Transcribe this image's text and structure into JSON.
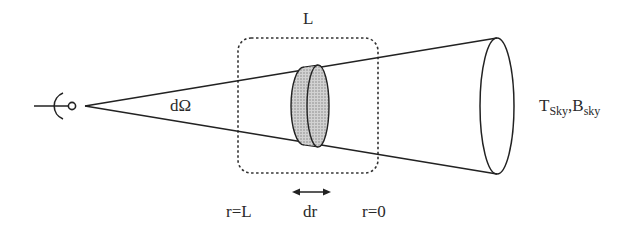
{
  "diagram": {
    "labels": {
      "box_length": "L",
      "solid_angle": "dΩ",
      "sky_T_main": "T",
      "sky_T_sub": "Sky",
      "sky_sep": ",",
      "sky_B_main": "B",
      "sky_B_sub": "sky",
      "r_far": "r=L",
      "slab_thickness": "dr",
      "r_near": "r=0"
    },
    "elements": {
      "observer": "antenna-icon",
      "beam": "cone",
      "slab": "shaded-disk",
      "region": "dashed-rounded-box",
      "arrow": "double-headed-arrow"
    },
    "colors": {
      "stroke": "#222222",
      "slab_fill": "#b8b8b8",
      "dashed": "#333333"
    }
  }
}
